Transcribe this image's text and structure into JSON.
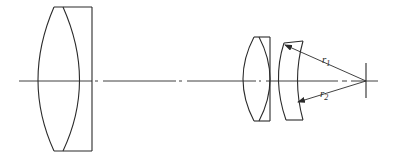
{
  "diagram": {
    "type": "optical-lens-cross-section",
    "colors": {
      "line": "#2b2b2b",
      "background": "#ffffff"
    },
    "elements": [
      {
        "id": "front-cemented-doublet",
        "kind": "cemented doublet (biconvex + plano)"
      },
      {
        "id": "rear-doublet",
        "kind": "biconvex + plano element"
      },
      {
        "id": "meniscus",
        "kind": "negative meniscus element"
      },
      {
        "id": "center-of-curvature",
        "kind": "cross mark on axis"
      }
    ],
    "labels": {
      "r1": {
        "base": "r",
        "sub": "1"
      },
      "r2": {
        "base": "r",
        "sub": "2"
      }
    }
  }
}
